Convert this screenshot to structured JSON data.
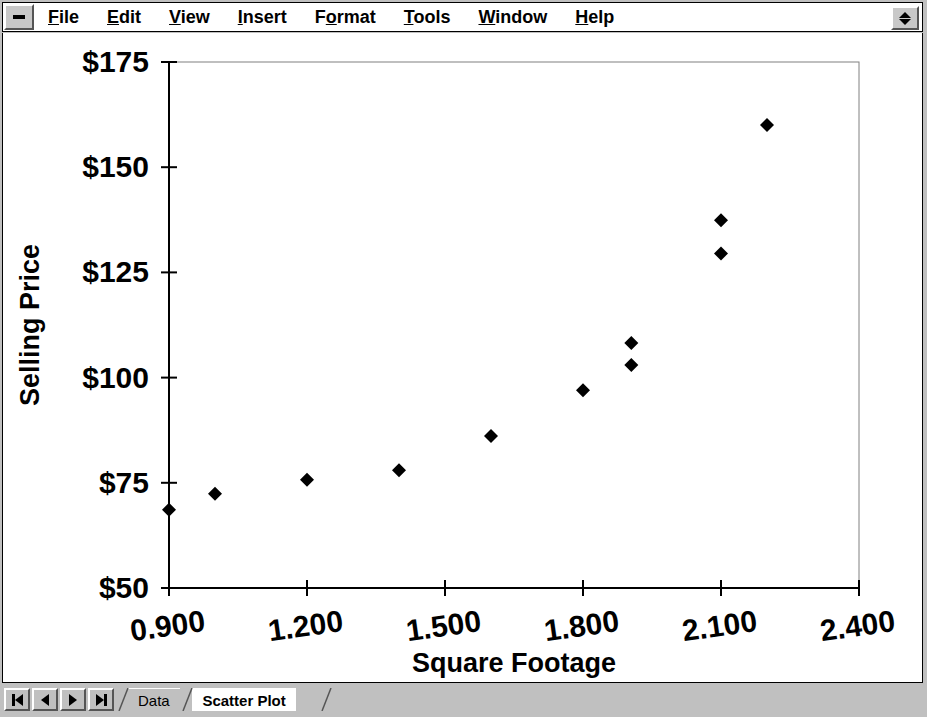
{
  "window": {
    "control_menu_icon": "window-control-box",
    "spinner_icon": "up-down-spinner"
  },
  "menubar": {
    "items": [
      {
        "label": "File",
        "accel": "F",
        "name": "menu-file"
      },
      {
        "label": "Edit",
        "accel": "E",
        "name": "menu-edit"
      },
      {
        "label": "View",
        "accel": "V",
        "name": "menu-view"
      },
      {
        "label": "Insert",
        "accel": "I",
        "name": "menu-insert"
      },
      {
        "label": "Format",
        "accel": "o",
        "name": "menu-format"
      },
      {
        "label": "Tools",
        "accel": "T",
        "name": "menu-tools"
      },
      {
        "label": "Window",
        "accel": "W",
        "name": "menu-window"
      },
      {
        "label": "Help",
        "accel": "H",
        "name": "menu-help"
      }
    ]
  },
  "tabbar": {
    "nav": [
      {
        "name": "tab-nav-first",
        "icon": "first-record-icon"
      },
      {
        "name": "tab-nav-previous",
        "icon": "previous-record-icon"
      },
      {
        "name": "tab-nav-next",
        "icon": "next-record-icon"
      },
      {
        "name": "tab-nav-last",
        "icon": "last-record-icon"
      }
    ],
    "sheets": [
      {
        "label": "Data",
        "active": false
      },
      {
        "label": "Scatter Plot",
        "active": true
      }
    ]
  },
  "chart_data": {
    "type": "scatter",
    "title": "",
    "xlabel": "Square Footage",
    "ylabel": "Selling Price",
    "xlim": [
      0.9,
      2.4
    ],
    "ylim": [
      50,
      175
    ],
    "xticks": [
      0.9,
      1.2,
      1.5,
      1.8,
      2.1,
      2.4
    ],
    "xticklabels": [
      "0.900",
      "1.200",
      "1.500",
      "1.800",
      "2.100",
      "2.400"
    ],
    "yticks": [
      50,
      75,
      100,
      125,
      150,
      175
    ],
    "yticklabels": [
      "$50",
      "$75",
      "$100",
      "$125",
      "$150",
      "$175"
    ],
    "grid": false,
    "legend": false,
    "marker": "diamond",
    "marker_color": "#000000",
    "plot_border_color": "#808080",
    "axis_color": "#000000",
    "background": "#ffffff",
    "xtick_label_rotation": -8,
    "series": [
      {
        "name": "Selling Price vs Square Footage",
        "points": [
          {
            "x": 0.9,
            "y": 68.6
          },
          {
            "x": 1.0,
            "y": 72.4
          },
          {
            "x": 1.2,
            "y": 75.7
          },
          {
            "x": 1.4,
            "y": 78.0
          },
          {
            "x": 1.6,
            "y": 86.1
          },
          {
            "x": 1.8,
            "y": 97.0
          },
          {
            "x": 1.905,
            "y": 108.2
          },
          {
            "x": 1.905,
            "y": 103.0
          },
          {
            "x": 2.1,
            "y": 137.4
          },
          {
            "x": 2.1,
            "y": 129.5
          },
          {
            "x": 2.2,
            "y": 160.0
          }
        ]
      }
    ]
  }
}
